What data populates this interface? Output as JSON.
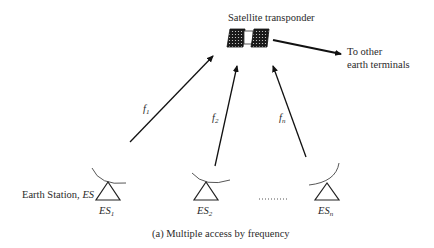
{
  "diagram": {
    "satellite": {
      "label": "Satellite transponder",
      "icon": "satellite-icon"
    },
    "outbound": {
      "line1": "To other",
      "line2": "earth terminals"
    },
    "uplinks": [
      {
        "label": "f",
        "sub": "1",
        "from": "ES1"
      },
      {
        "label": "f",
        "sub": "2",
        "from": "ES2"
      },
      {
        "label": "f",
        "sub": "n",
        "from": "ESn"
      }
    ],
    "stations": [
      {
        "label": "ES",
        "sub": "1",
        "icon": "antenna-icon"
      },
      {
        "label": "ES",
        "sub": "2",
        "icon": "antenna-icon"
      },
      {
        "label": "ES",
        "sub": "n",
        "icon": "antenna-icon"
      }
    ],
    "station_caption": {
      "text": "Earth Station, ",
      "italic": "ES"
    },
    "ellipsis": "………",
    "caption": "(a) Multiple access by frequency"
  }
}
